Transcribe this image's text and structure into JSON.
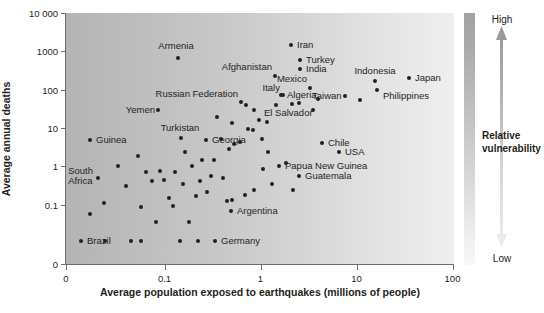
{
  "chart_data": {
    "type": "scatter",
    "title": "",
    "xlabel": "Average population exposed to earthquakes (millions of people)",
    "ylabel": "Average annual deaths",
    "xticks": [
      "0",
      "0.1",
      "1",
      "10",
      "100"
    ],
    "yticks": [
      "10 000",
      "1000",
      "100",
      "10",
      "1",
      "0.1",
      "0"
    ],
    "xlim_note": "log scale from 0.1 to 100 with a 0 origin break",
    "ylim_note": "log scale from 0.1 to 10 000 with a 0 origin break",
    "grid": false,
    "legend": {
      "position": "right",
      "title": "Relative vulnerability",
      "high_label": "High",
      "low_label": "Low",
      "gradient_top_color": "#a2a2a2",
      "gradient_bottom_color": "#f7f7f7"
    },
    "background_gradient": {
      "direction": "left-to-right",
      "left_color": "#b4b4b4",
      "right_color": "#efefef"
    },
    "point_color": "#231f20",
    "labeled_points": [
      {
        "name": "Armenia",
        "x": 0.19,
        "y": 1200,
        "px": 178,
        "py": 58,
        "lx": 176,
        "ly": 46,
        "anchor": "c"
      },
      {
        "name": "Iran",
        "x": 3.1,
        "y": 2100,
        "px": 291,
        "py": 45,
        "lx": 297,
        "ly": 45,
        "anchor": "l"
      },
      {
        "name": "Turkey",
        "x": 4.2,
        "y": 900,
        "px": 300,
        "py": 60,
        "lx": 306,
        "ly": 60,
        "anchor": "l"
      },
      {
        "name": "India",
        "x": 4.2,
        "y": 620,
        "px": 300,
        "py": 69,
        "lx": 306,
        "ly": 69,
        "anchor": "l"
      },
      {
        "name": "Afghanistan",
        "x": 2.0,
        "y": 480,
        "px": 275,
        "py": 76,
        "lx": 272,
        "ly": 67,
        "anchor": "r"
      },
      {
        "name": "Mexico",
        "x": 4.4,
        "y": 310,
        "px": 310,
        "py": 88,
        "lx": 307,
        "ly": 79,
        "anchor": "r"
      },
      {
        "name": "Indonesia",
        "x": 10.5,
        "y": 290,
        "px": 375,
        "py": 81,
        "lx": 375,
        "ly": 71,
        "anchor": "c"
      },
      {
        "name": "Japan",
        "x": 26,
        "y": 300,
        "px": 409,
        "py": 78,
        "lx": 415,
        "ly": 78,
        "anchor": "l"
      },
      {
        "name": "Italy",
        "x": 2.6,
        "y": 240,
        "px": 283,
        "py": 95,
        "lx": 280,
        "ly": 88,
        "anchor": "r"
      },
      {
        "name": "Algeria",
        "x": 2.4,
        "y": 170,
        "px": 281,
        "py": 95,
        "lx": 287,
        "ly": 95,
        "anchor": "l"
      },
      {
        "name": "Taiwan",
        "x": 7.0,
        "y": 150,
        "px": 345,
        "py": 96,
        "lx": 312,
        "ly": 96,
        "anchor": "l"
      },
      {
        "name": "Philippines",
        "x": 10.8,
        "y": 130,
        "px": 377,
        "py": 90,
        "lx": 383,
        "ly": 96,
        "anchor": "l"
      },
      {
        "name": "Russian Federation",
        "x": 1.15,
        "y": 115,
        "px": 241,
        "py": 102,
        "lx": 238,
        "ly": 94,
        "anchor": "r"
      },
      {
        "name": "Yemen",
        "x": 0.26,
        "y": 70,
        "px": 158,
        "py": 110,
        "lx": 155,
        "ly": 110,
        "anchor": "r"
      },
      {
        "name": "El Salvador",
        "x": 1.55,
        "y": 46,
        "px": 259,
        "py": 120,
        "lx": 264,
        "ly": 113,
        "anchor": "l"
      },
      {
        "name": "Turkistan",
        "x": 0.44,
        "y": 15,
        "px": 181,
        "py": 138,
        "lx": 180,
        "ly": 128,
        "anchor": "c"
      },
      {
        "name": "Georgia",
        "x": 0.66,
        "y": 14,
        "px": 206,
        "py": 140,
        "lx": 212,
        "ly": 140,
        "anchor": "l"
      },
      {
        "name": "Guinea",
        "x": 0.043,
        "y": 13,
        "px": 90,
        "py": 140,
        "lx": 96,
        "ly": 140,
        "anchor": "l"
      },
      {
        "name": "Chile",
        "x": 5.4,
        "y": 11,
        "px": 322,
        "py": 143,
        "lx": 328,
        "ly": 143,
        "anchor": "l"
      },
      {
        "name": "USA",
        "x": 7.6,
        "y": 8.5,
        "px": 339,
        "py": 152,
        "lx": 345,
        "ly": 152,
        "anchor": "l"
      },
      {
        "name": "Papua New Guinea",
        "x": 2.0,
        "y": 5.2,
        "px": 279,
        "py": 166,
        "lx": 285,
        "ly": 166,
        "anchor": "l"
      },
      {
        "name": "Guatemala",
        "x": 3.2,
        "y": 3.6,
        "px": 299,
        "py": 176,
        "lx": 305,
        "ly": 176,
        "anchor": "l"
      },
      {
        "name": "South Africa",
        "x": 0.055,
        "y": 1.3,
        "px": 98,
        "py": 178,
        "lx": 93,
        "ly": 172,
        "anchor": "r"
      },
      {
        "name": "Argentina",
        "x": 0.78,
        "y": 0.42,
        "px": 231,
        "py": 211,
        "lx": 237,
        "ly": 211,
        "anchor": "l"
      },
      {
        "name": "Germany",
        "x": 0.62,
        "y": 0.05,
        "px": 215,
        "py": 241,
        "lx": 221,
        "ly": 241,
        "anchor": "l"
      },
      {
        "name": "Brazil",
        "x": 0.027,
        "y": 0.05,
        "px": 81,
        "py": 241,
        "lx": 87,
        "ly": 241,
        "anchor": "l"
      }
    ],
    "unlabeled_points": [
      {
        "px": 185,
        "py": 152
      },
      {
        "px": 202,
        "py": 160
      },
      {
        "px": 221,
        "py": 139
      },
      {
        "px": 248,
        "py": 129
      },
      {
        "px": 253,
        "py": 130
      },
      {
        "px": 229,
        "py": 149
      },
      {
        "px": 234,
        "py": 144
      },
      {
        "px": 240,
        "py": 142
      },
      {
        "px": 267,
        "py": 122
      },
      {
        "px": 254,
        "py": 110
      },
      {
        "px": 217,
        "py": 117
      },
      {
        "px": 232,
        "py": 123
      },
      {
        "px": 262,
        "py": 139
      },
      {
        "px": 211,
        "py": 176
      },
      {
        "px": 246,
        "py": 105
      },
      {
        "px": 268,
        "py": 152
      },
      {
        "px": 313,
        "py": 110
      },
      {
        "px": 276,
        "py": 105
      },
      {
        "px": 292,
        "py": 104
      },
      {
        "px": 299,
        "py": 103
      },
      {
        "px": 318,
        "py": 99
      },
      {
        "px": 360,
        "py": 100
      },
      {
        "px": 138,
        "py": 156
      },
      {
        "px": 146,
        "py": 172
      },
      {
        "px": 126,
        "py": 186
      },
      {
        "px": 118,
        "py": 166
      },
      {
        "px": 152,
        "py": 181
      },
      {
        "px": 160,
        "py": 171
      },
      {
        "px": 164,
        "py": 180
      },
      {
        "px": 175,
        "py": 172
      },
      {
        "px": 183,
        "py": 184
      },
      {
        "px": 192,
        "py": 166
      },
      {
        "px": 207,
        "py": 192
      },
      {
        "px": 223,
        "py": 178
      },
      {
        "px": 232,
        "py": 200
      },
      {
        "px": 227,
        "py": 201
      },
      {
        "px": 245,
        "py": 195
      },
      {
        "px": 104,
        "py": 203
      },
      {
        "px": 141,
        "py": 207
      },
      {
        "px": 173,
        "py": 206
      },
      {
        "px": 196,
        "py": 196
      },
      {
        "px": 156,
        "py": 222
      },
      {
        "px": 189,
        "py": 222
      },
      {
        "px": 90,
        "py": 214
      },
      {
        "px": 105,
        "py": 241
      },
      {
        "px": 131,
        "py": 241
      },
      {
        "px": 141,
        "py": 241
      },
      {
        "px": 180,
        "py": 241
      },
      {
        "px": 198,
        "py": 241
      },
      {
        "px": 254,
        "py": 190
      },
      {
        "px": 263,
        "py": 169
      },
      {
        "px": 272,
        "py": 184
      },
      {
        "px": 286,
        "py": 163
      },
      {
        "px": 293,
        "py": 190
      },
      {
        "px": 169,
        "py": 198
      },
      {
        "px": 214,
        "py": 160
      },
      {
        "px": 200,
        "py": 181
      }
    ]
  }
}
